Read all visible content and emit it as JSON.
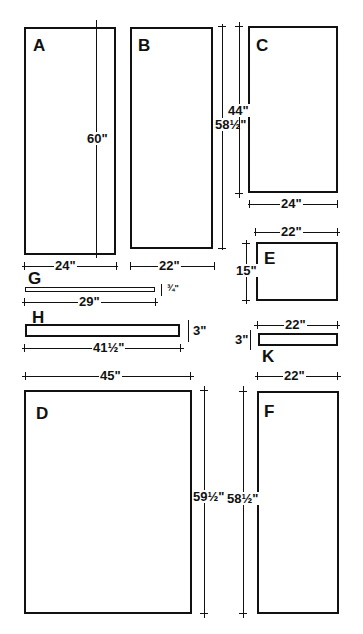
{
  "panels": {
    "A": {
      "label": "A",
      "width": "24\"",
      "height": "60\""
    },
    "B": {
      "label": "B",
      "width": "22\"",
      "height": "58½\""
    },
    "C": {
      "label": "C",
      "width": "24\"",
      "height": "44\""
    },
    "D": {
      "label": "D",
      "width": "45\"",
      "height": "59½\""
    },
    "E": {
      "label": "E",
      "width": "22\"",
      "height": "15\""
    },
    "F": {
      "label": "F",
      "width": "22\"",
      "height": "58½\""
    },
    "G": {
      "label": "G",
      "width": "29\"",
      "height": "¾\""
    },
    "H": {
      "label": "H",
      "width": "41½\"",
      "height": "3\""
    },
    "K": {
      "label": "K",
      "width": "22\"",
      "height": "3\""
    }
  },
  "colors": {
    "line": "#111111",
    "background": "#ffffff"
  }
}
